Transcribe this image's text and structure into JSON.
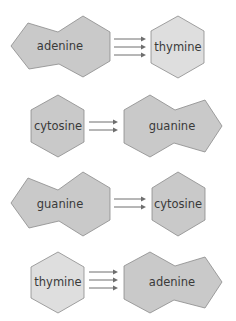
{
  "colors": {
    "purine": "#c9c9c9",
    "cytosine": "#c9c9c9",
    "thymine": "#dedede",
    "edge": "#8a8a8a",
    "arrow": "#6e6e6e",
    "text": "#3a3a3a"
  },
  "pairs": [
    {
      "left": {
        "name": "adenine",
        "type": "purine"
      },
      "right": {
        "name": "thymine",
        "type": "pyrimidine"
      },
      "bonds": 3
    },
    {
      "left": {
        "name": "cytosine",
        "type": "pyrimidine"
      },
      "right": {
        "name": "guanine",
        "type": "purine"
      },
      "bonds": 2
    },
    {
      "left": {
        "name": "guanine",
        "type": "purine"
      },
      "right": {
        "name": "cytosine",
        "type": "pyrimidine"
      },
      "bonds": 2
    },
    {
      "left": {
        "name": "thymine",
        "type": "pyrimidine"
      },
      "right": {
        "name": "adenine",
        "type": "purine"
      },
      "bonds": 3
    }
  ]
}
